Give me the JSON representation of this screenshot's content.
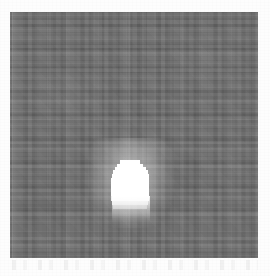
{
  "page": {
    "title": "Grayscale source field",
    "background_color": "#fdfdfd",
    "width": 270,
    "height": 276
  },
  "image_field": {
    "name": "grayscale-noise-field",
    "description": "Noisy grayscale scientific image frame",
    "background_color": "#6e6e6e",
    "left": 10,
    "top": 12,
    "width": 248,
    "height": 246,
    "noise_texture": "blocky-pixel-noise",
    "artifacts": {
      "column_streak": {
        "name": "vertical-column-streak",
        "left": 128,
        "width": 3,
        "color": "#7d7d7d"
      },
      "left_edge_band": {
        "name": "left-edge-brightness-band",
        "left": 2,
        "width": 6,
        "color": "#787878"
      }
    }
  },
  "source_blob": {
    "name": "bright-point-source",
    "description": "Saturated white point source, pixelated blocky edges with a soft downward gradient tail",
    "core_color": "#ffffff",
    "center_x": 130,
    "center_y": 182,
    "left": 110,
    "top": 160,
    "width": 42,
    "height": 46,
    "rows": [
      {
        "top": 0,
        "left": 10,
        "width": 20,
        "height": 4
      },
      {
        "top": 4,
        "left": 7,
        "width": 26,
        "height": 3
      },
      {
        "top": 7,
        "left": 5,
        "width": 31,
        "height": 3
      },
      {
        "top": 10,
        "left": 3,
        "width": 35,
        "height": 4
      },
      {
        "top": 14,
        "left": 2,
        "width": 37,
        "height": 4
      },
      {
        "top": 18,
        "left": 1,
        "width": 38,
        "height": 18
      },
      {
        "top": 36,
        "left": 1,
        "width": 38,
        "height": 5,
        "dim": 1
      },
      {
        "top": 41,
        "left": 2,
        "width": 36,
        "height": 4,
        "dim": 2
      },
      {
        "top": 45,
        "left": 3,
        "width": 34,
        "height": 4,
        "dim": 3
      }
    ]
  },
  "bottom_artifact": {
    "name": "scan-smudge-artifact",
    "description": "Faint horizontal smudge marks below the image frame"
  }
}
